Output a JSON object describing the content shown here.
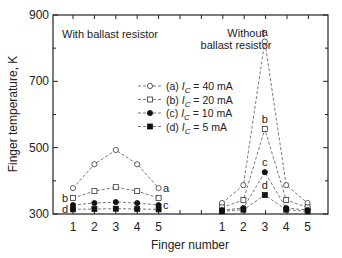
{
  "chart_data": {
    "type": "line",
    "title": "",
    "xlabel": "Finger number",
    "ylabel": "Finger temperature, K",
    "ylim": [
      300,
      900
    ],
    "yticks": [
      300,
      500,
      700,
      900
    ],
    "grid": false,
    "legend_position": "center",
    "panels": [
      {
        "label": "With ballast resistor",
        "x": [
          1,
          2,
          3,
          4,
          5
        ],
        "series": [
          {
            "name": "(a) I_C = 40 mA",
            "marker": "open-circle",
            "values": [
              378,
              450,
              493,
              450,
              378
            ]
          },
          {
            "name": "(b) I_C = 20 mA",
            "marker": "open-square",
            "values": [
              348,
              369,
              381,
              369,
              348
            ]
          },
          {
            "name": "(c) I_C = 10 mA",
            "marker": "filled-circle",
            "values": [
              327,
              333,
              336,
              333,
              327
            ]
          },
          {
            "name": "(d) I_C = 5 mA",
            "marker": "filled-square",
            "values": [
              314,
              315,
              316,
              315,
              314
            ]
          }
        ]
      },
      {
        "label": "Without ballast resistor",
        "x": [
          1,
          2,
          3,
          4,
          5
        ],
        "series": [
          {
            "name": "(a) I_C = 40 mA",
            "marker": "open-circle",
            "values": [
              333,
              387,
              820,
              387,
              333
            ]
          },
          {
            "name": "(b) I_C = 20 mA",
            "marker": "open-square",
            "values": [
              320,
              342,
              556,
              342,
              320
            ]
          },
          {
            "name": "(c) I_C = 10 mA",
            "marker": "filled-circle",
            "values": [
              312,
              318,
              426,
              318,
              312
            ]
          },
          {
            "name": "(d) I_C = 5 mA",
            "marker": "filled-square",
            "values": [
              308,
              313,
              357,
              313,
              308
            ]
          }
        ]
      }
    ],
    "curve_labels": [
      "a",
      "b",
      "c",
      "d"
    ],
    "legend": [
      {
        "prefix": "(a) ",
        "italic": "I",
        "sub": "C",
        "suffix": " = 40 mA",
        "marker": "open-circle"
      },
      {
        "prefix": "(b) ",
        "italic": "I",
        "sub": "C",
        "suffix": " = 20 mA",
        "marker": "open-square"
      },
      {
        "prefix": "(c) ",
        "italic": "I",
        "sub": "C",
        "suffix": " = 10 mA",
        "marker": "filled-circle"
      },
      {
        "prefix": "(d) ",
        "italic": "I",
        "sub": "C",
        "suffix": " =   5 mA",
        "marker": "filled-square"
      }
    ]
  },
  "annotations": {
    "left_panel_title": "With ballast resistor",
    "right_panel_title_line1": "Without",
    "right_panel_title_line2": "ballast resistor"
  },
  "colors": {
    "line": "#555555",
    "axis": "#222222"
  }
}
